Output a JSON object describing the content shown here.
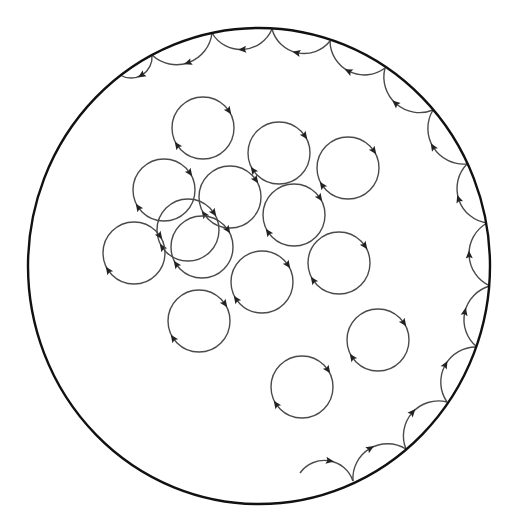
{
  "diagram": {
    "type": "vortex-circulation",
    "colors": {
      "background": "#ffffff",
      "boundary": "#111111",
      "orbit": "#4a4a4a",
      "arrowhead": "#222222"
    },
    "boundary": {
      "cx": 259,
      "cy": 266,
      "rx": 231,
      "ry": 238
    },
    "interior_orbits": [
      {
        "cx": 203,
        "cy": 128,
        "r": 31,
        "direction": "clockwise"
      },
      {
        "cx": 279,
        "cy": 153,
        "r": 31,
        "direction": "clockwise"
      },
      {
        "cx": 348,
        "cy": 168,
        "r": 31,
        "direction": "clockwise"
      },
      {
        "cx": 164,
        "cy": 190,
        "r": 31,
        "direction": "clockwise"
      },
      {
        "cx": 230,
        "cy": 197,
        "r": 31,
        "direction": "clockwise"
      },
      {
        "cx": 294,
        "cy": 215,
        "r": 31,
        "direction": "clockwise"
      },
      {
        "cx": 188,
        "cy": 230,
        "r": 31,
        "direction": "clockwise"
      },
      {
        "cx": 202,
        "cy": 247,
        "r": 31,
        "direction": "clockwise"
      },
      {
        "cx": 134,
        "cy": 253,
        "r": 31,
        "direction": "clockwise"
      },
      {
        "cx": 339,
        "cy": 263,
        "r": 31,
        "direction": "clockwise"
      },
      {
        "cx": 262,
        "cy": 282,
        "r": 31,
        "direction": "clockwise"
      },
      {
        "cx": 199,
        "cy": 321,
        "r": 31,
        "direction": "clockwise"
      },
      {
        "cx": 378,
        "cy": 340,
        "r": 31,
        "direction": "clockwise"
      },
      {
        "cx": 302,
        "cy": 387,
        "r": 31,
        "direction": "clockwise"
      }
    ],
    "edge_orbit_cusps": [
      [
        120,
        75
      ],
      [
        152,
        55
      ],
      [
        212,
        33
      ],
      [
        272,
        29
      ],
      [
        330,
        41
      ],
      [
        385,
        68
      ],
      [
        433,
        110
      ],
      [
        467,
        164
      ],
      [
        487,
        223
      ],
      [
        490,
        286
      ],
      [
        477,
        347
      ],
      [
        447,
        402
      ],
      [
        406,
        449
      ],
      [
        353,
        481
      ],
      [
        300,
        473
      ]
    ],
    "edge_orbit_direction": "counterclockwise-skipping"
  }
}
